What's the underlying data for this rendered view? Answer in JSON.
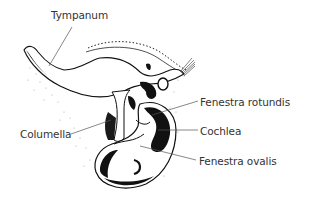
{
  "diagram": {
    "type": "anatomical-illustration",
    "labels": [
      {
        "id": "tympanum",
        "text": "Tympanum",
        "x": 51,
        "y": 10
      },
      {
        "id": "columella",
        "text": "Columella",
        "x": 20,
        "y": 129
      },
      {
        "id": "fenestra-rotundis",
        "text": "Fenestra rotundis",
        "x": 200,
        "y": 97
      },
      {
        "id": "cochlea",
        "text": "Cochlea",
        "x": 200,
        "y": 126
      },
      {
        "id": "fenestra-ovalis",
        "text": "Fenestra ovalis",
        "x": 199,
        "y": 156
      }
    ],
    "colors": {
      "background": "#ffffff",
      "ink": "#111111",
      "label_text": "#333333",
      "leader_line": "#555555"
    }
  }
}
